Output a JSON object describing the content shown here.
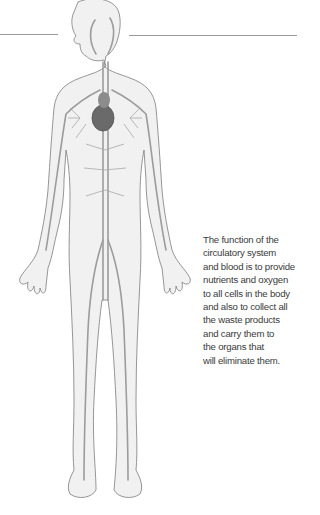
{
  "figure": {
    "colors": {
      "outline": "#8a8a8a",
      "vessel": "#9c9c9c",
      "body_fill": "#f1f1f1",
      "heart": "#6a6a6a"
    }
  },
  "caption": {
    "lines": [
      "The function of the",
      "circulatory system",
      "and blood is to provide",
      "nutrients and oxygen",
      "to all cells in the body",
      "and also to collect all",
      "the waste products",
      "and carry them to",
      "the organs that",
      "will eliminate them."
    ]
  }
}
